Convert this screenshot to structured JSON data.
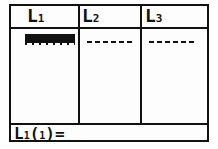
{
  "list_editor": {
    "columns": [
      {
        "name": "L",
        "index": "1",
        "first_value": ""
      },
      {
        "name": "L",
        "index": "2",
        "first_value": "------"
      },
      {
        "name": "L",
        "index": "3",
        "first_value": "------"
      }
    ],
    "entry_line": {
      "list": "L",
      "list_index": "1",
      "prefix": "(",
      "element": "1",
      "suffix": ")="
    }
  }
}
